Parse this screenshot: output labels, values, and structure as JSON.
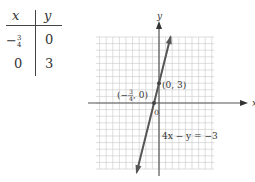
{
  "table": {
    "headers": [
      "x",
      "y"
    ],
    "rows": [
      {
        "x_sign": "−",
        "x_num": "3",
        "x_den": "4",
        "y": "0"
      },
      {
        "x": "0",
        "y": "3"
      }
    ]
  },
  "graph": {
    "x_axis_label": "x",
    "y_axis_label": "y",
    "origin_label": "0",
    "point1_label": "(0, 3)",
    "point2_label_prefix": "(−",
    "point2_label_num": "3",
    "point2_label_den": "4",
    "point2_label_suffix": ", 0)",
    "equation_label": "4x − y = −3"
  },
  "chart_data": {
    "type": "line",
    "title": "",
    "xlabel": "x",
    "ylabel": "y",
    "equation": "4x - y = -3",
    "series": [
      {
        "name": "4x - y = -3",
        "points": [
          [
            -0.75,
            0
          ],
          [
            0,
            3
          ]
        ]
      }
    ],
    "table": {
      "columns": [
        "x",
        "y"
      ],
      "rows": [
        [
          -0.75,
          0
        ],
        [
          0,
          3
        ]
      ]
    },
    "xlim": [
      -9,
      8
    ],
    "ylim": [
      -10,
      10
    ],
    "grid": true,
    "line_color": "#555555"
  }
}
